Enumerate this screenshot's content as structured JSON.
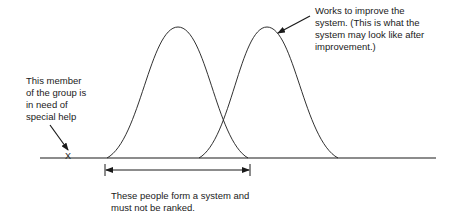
{
  "labels": {
    "member_needs_help": "This member\nof the group is\nin need of\nspecial help",
    "works_to_improve": "Works to improve the\nsystem.  (This is what the\nsystem may look like after\nimprovement.)",
    "system_not_ranked": "These people form a system and\nmust not be ranked.",
    "outlier_marker": "X"
  },
  "diagram": {
    "baseline": {
      "x1": 40,
      "x2": 436,
      "y": 158
    },
    "curves": [
      {
        "name": "current-system",
        "start_x": 107,
        "peak_x": 178,
        "peak_y": 27,
        "end_x": 248
      },
      {
        "name": "improved-system",
        "start_x": 199,
        "peak_x": 267,
        "peak_y": 27,
        "end_x": 338
      }
    ],
    "range_arrow": {
      "x1": 105,
      "x2": 250,
      "y": 170
    },
    "colors": {
      "line": "#1a1a1a",
      "background": "#ffffff"
    }
  }
}
